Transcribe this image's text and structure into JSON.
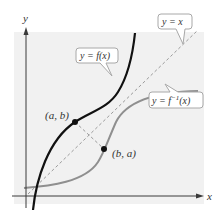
{
  "diagram": {
    "colors": {
      "panel": "#f1f1f1",
      "axis": "#3a3a3a",
      "f_curve": "#111111",
      "finv_curve": "#8f8f8f",
      "identity_line": "#9a9a9a",
      "callout_border": "#a8a8a8",
      "callout_fill": "#ffffff",
      "text": "#333333"
    },
    "axes": {
      "x_label": "x",
      "y_label": "y"
    },
    "labels": {
      "f": "y = f(x)",
      "identity": "y = x",
      "finv_prefix": "y = f",
      "finv_sup": "−1",
      "finv_suffix": "(x)"
    },
    "points": [
      {
        "name": "point-a-b",
        "label": "(a, b)",
        "on": "f"
      },
      {
        "name": "point-b-a",
        "label": "(b, a)",
        "on": "f_inverse"
      }
    ]
  }
}
